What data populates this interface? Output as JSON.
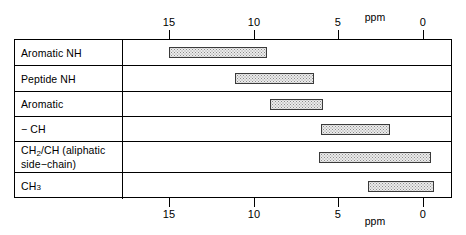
{
  "chart_data": {
    "type": "bar",
    "title": "",
    "xlabel": "ppm",
    "ylabel": "",
    "orientation": "horizontal",
    "axis_unit": "ppm",
    "xlim": [
      16.5,
      -1.7
    ],
    "x_reversed": true,
    "grid": false,
    "legend": "none",
    "ticks": [
      15,
      10,
      5,
      0
    ],
    "tick_labels": [
      "15",
      "10",
      "5",
      "0"
    ],
    "axes_shown": [
      "top",
      "bottom"
    ],
    "categories": [
      "Aromatic NH",
      "Peptide NH",
      "Aromatic",
      "− CH",
      "CH2/CH (aliphatic side−chain)",
      "CH3"
    ],
    "ranges_ppm": [
      [
        15.0,
        9.2
      ],
      [
        11.1,
        6.4
      ],
      [
        9.0,
        5.9
      ],
      [
        6.0,
        1.9
      ],
      [
        6.1,
        -0.5
      ],
      [
        3.25,
        -0.7
      ]
    ]
  },
  "axis": {
    "unit_label": "ppm",
    "ticks": [
      {
        "value": 15,
        "label": "15"
      },
      {
        "value": 10,
        "label": "10"
      },
      {
        "value": 5,
        "label": "5"
      },
      {
        "value": 0,
        "label": "0"
      }
    ]
  },
  "rows": [
    {
      "label": "Aromatic NH",
      "label_html": "Aromatic NH",
      "from_ppm": 15.0,
      "to_ppm": 9.2
    },
    {
      "label": "Peptide NH",
      "label_html": "Peptide NH",
      "from_ppm": 11.1,
      "to_ppm": 6.4
    },
    {
      "label": "Aromatic",
      "label_html": "Aromatic",
      "from_ppm": 9.0,
      "to_ppm": 5.9
    },
    {
      "label": "− CH",
      "label_html": "− CH",
      "from_ppm": 6.0,
      "to_ppm": 1.9
    },
    {
      "label": "CH2/CH (aliphatic side−chain)",
      "label_line1_pre": "CH",
      "label_line1_sub": "2",
      "label_line1_post": "/CH (aliphatic",
      "label_line2": "side−chain)",
      "from_ppm": 6.1,
      "to_ppm": -0.5
    },
    {
      "label": "CH3",
      "label_pre": "CH",
      "label_sub": "3",
      "from_ppm": 3.25,
      "to_ppm": -0.7
    }
  ],
  "colors": {
    "bar_fill": "#ebebeb",
    "bar_stipple": "#8d8d8d",
    "bar_border": "#3a3a3a",
    "line": "#000000",
    "background": "#ffffff"
  }
}
